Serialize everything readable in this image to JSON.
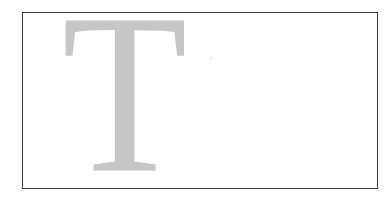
{
  "figure": {
    "drop_cap": {
      "letter": "T",
      "color": "#c6c6c6"
    },
    "frame": {
      "border_color": "#3a3a3a",
      "background": "#ffffff"
    }
  }
}
